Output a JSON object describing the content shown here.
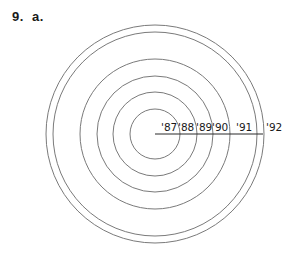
{
  "problem": {
    "number": "9.",
    "part": "a."
  },
  "diagram": {
    "type": "concentric-circles",
    "center": [
      155,
      134
    ],
    "stroke_color": "#7a7a7a",
    "axis_color": "#2a2a2a",
    "radii": [
      25,
      42,
      58,
      75,
      102,
      109
    ],
    "year_labels": [
      {
        "text": "'87",
        "x": 161
      },
      {
        "text": "'88",
        "x": 178
      },
      {
        "text": "'89",
        "x": 196
      },
      {
        "text": "'90",
        "x": 212
      },
      {
        "text": "'91",
        "x": 236
      },
      {
        "text": "'92",
        "x": 266
      }
    ]
  }
}
